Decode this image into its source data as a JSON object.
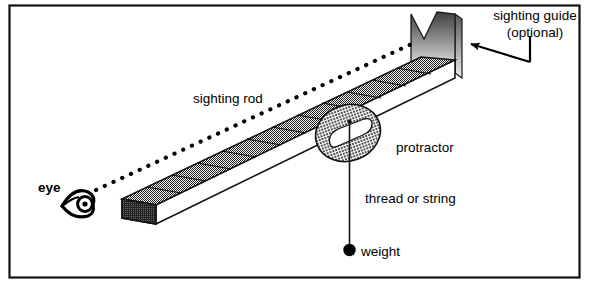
{
  "figure": {
    "background_color": "#ffffff",
    "border_color": "#000000",
    "ink_color": "#000000",
    "rod_fill_color": "#4d4d4d",
    "rod_side_color": "#ffffff",
    "rod_endcap_color": "#333333",
    "protractor_fill_color": "#8c8c8c",
    "guide_gradient_dark": "#4a4a4a",
    "guide_gradient_light": "#e8e8e8"
  },
  "labels": {
    "sighting_rod": "sighting rod",
    "sighting_guide_line1": "sighting guide",
    "sighting_guide_line2": "(optional)",
    "protractor": "protractor",
    "thread_or_string": "thread or string",
    "weight": "weight",
    "eye": "eye"
  },
  "parts": {
    "rod": {
      "name": "sighting rod",
      "segment_count": 12,
      "description": "rectangular graduated rod drawn in oblique perspective"
    },
    "sighting_guide": {
      "name": "sighting guide",
      "optional": true,
      "shape": "v-notch plate"
    },
    "protractor": {
      "name": "protractor",
      "shape": "semicircular disc with slot"
    },
    "thread": {
      "name": "thread or string",
      "attached_to": "protractor pivot"
    },
    "weight": {
      "name": "weight",
      "shape": "filled circle"
    },
    "eye": {
      "name": "eye",
      "shape": "stylized side-view eye"
    },
    "sight_line": {
      "name": "line of sight",
      "style": "dotted"
    },
    "callout_arrow": {
      "name": "callout arrow",
      "points_to": "sighting guide"
    }
  }
}
